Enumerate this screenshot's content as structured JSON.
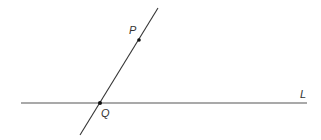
{
  "diagram": {
    "line_l": {
      "label": "L",
      "x1": 21,
      "y1": 103,
      "x2": 307,
      "y2": 103,
      "color": "#555555"
    },
    "line_pq": {
      "x1": 158,
      "y1": 8,
      "x2": 80,
      "y2": 135,
      "color": "#333333"
    },
    "point_p": {
      "label": "P",
      "x": 139,
      "y": 40
    },
    "point_q": {
      "label": "Q",
      "x": 100,
      "y": 103
    }
  }
}
